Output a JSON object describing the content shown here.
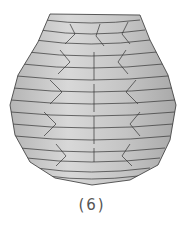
{
  "figure": {
    "caption": "(6)",
    "colors": {
      "fill_light": "#d4d4d4",
      "fill_mid": "#bdbdbd",
      "fill_dark": "#a8a8a8",
      "stroke": "#333333",
      "background": "#ffffff"
    }
  }
}
